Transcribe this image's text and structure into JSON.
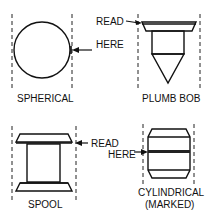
{
  "diagram": {
    "annotation_top": {
      "line1": "READ",
      "line2": "HERE"
    },
    "annotation_bottom": {
      "line1": "READ",
      "line2": "HERE"
    },
    "floats": [
      {
        "id": "spherical",
        "label": "SPHERICAL"
      },
      {
        "id": "plumb-bob",
        "label": "PLUMB BOB"
      },
      {
        "id": "spool",
        "label": "SPOOL"
      },
      {
        "id": "cylindrical",
        "label_line1": "CYLINDRICAL",
        "label_line2": "(MARKED)"
      }
    ]
  }
}
